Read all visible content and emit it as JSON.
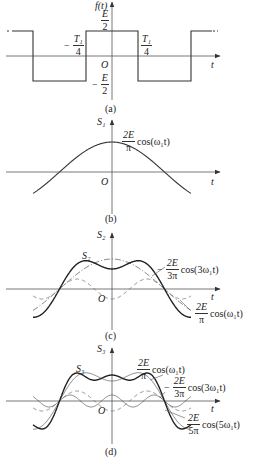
{
  "panels": [
    {
      "id": "a",
      "caption": "(a)",
      "y_axis_label": "f(t)",
      "x_axis_label": "t",
      "origin_label": "O",
      "labels": {
        "top_level": {
          "num": "E",
          "den": "2"
        },
        "bottom_level": {
          "sign": "−",
          "num": "E",
          "den": "2"
        },
        "left_edge": {
          "sign": "−",
          "num": "T₁",
          "den": "4"
        },
        "right_edge": {
          "num": "T₁",
          "den": "4"
        }
      }
    },
    {
      "id": "b",
      "caption": "(b)",
      "y_axis_label": "S₁",
      "x_axis_label": "t",
      "origin_label": "O",
      "term": {
        "num": "2E",
        "den": "π",
        "func": "cos(ω₁t)"
      }
    },
    {
      "id": "c",
      "caption": "(c)",
      "y_axis_label": "S₂",
      "x_axis_label": "t",
      "origin_label": "O",
      "curve_label": "S₂",
      "terms": [
        {
          "sign": "−",
          "num": "2E",
          "den": "3π",
          "func": "cos(3ω₁t)"
        },
        {
          "num": "2E",
          "den": "π",
          "func": "cos(ω₁t)"
        }
      ]
    },
    {
      "id": "d",
      "caption": "(d)",
      "y_axis_label": "S₃",
      "x_axis_label": "t",
      "origin_label": "O",
      "curve_label": "S₃",
      "terms": [
        {
          "num": "2E",
          "den": "π",
          "func": "cos(ω₁t)"
        },
        {
          "sign": "−",
          "num": "2E",
          "den": "3π",
          "func": "cos(3ω₁t)"
        },
        {
          "num": "2E",
          "den": "5π",
          "func": "cos(5ω₁t)"
        }
      ]
    }
  ],
  "colors": {
    "axis": "#444444",
    "curve": "#222222",
    "harmonic": "#666666"
  }
}
